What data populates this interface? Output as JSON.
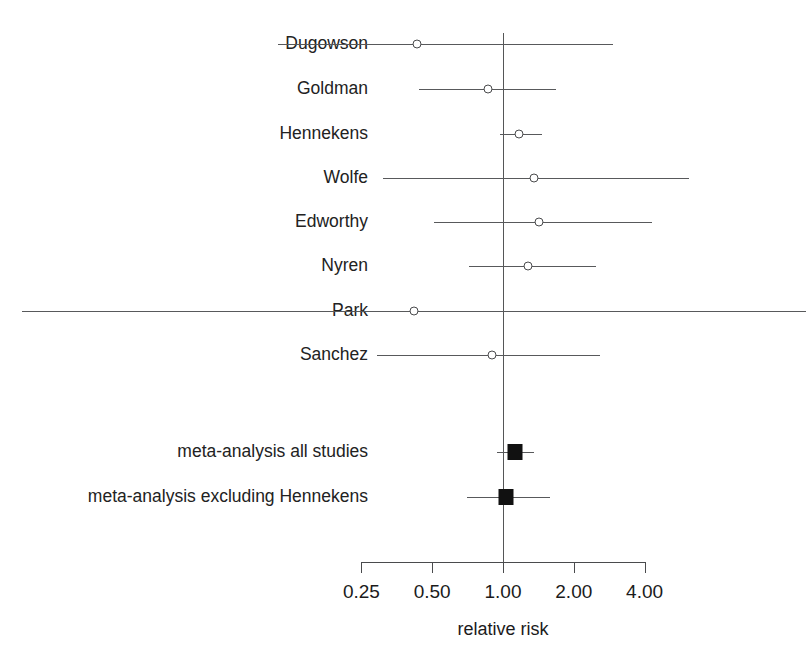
{
  "chart_data": {
    "type": "scatter",
    "subtype": "forest-plot",
    "title": "",
    "xlabel": "relative risk",
    "ylabel": "",
    "xscale": "log",
    "xlim": [
      0.25,
      4.0
    ],
    "grid": false,
    "legend": null,
    "null_line": 1.0,
    "tick_labels": [
      "0.25",
      "0.50",
      "1.00",
      "2.00",
      "4.00"
    ],
    "tick_values": [
      0.25,
      0.5,
      1.0,
      2.0,
      4.0
    ],
    "categories": [
      "Dugowson",
      "Goldman",
      "Hennekens",
      "Wolfe",
      "Edworthy",
      "Nyren",
      "Park",
      "Sanchez",
      "meta-analysis all studies",
      "meta-analysis excluding Hennekens"
    ],
    "rows": [
      {
        "label": "Dugowson",
        "marker": "open-circle",
        "estimate": 0.43,
        "ci_low": 0.11,
        "ci_high": 2.95,
        "ci_clipped_left": false,
        "ci_clipped_right": false
      },
      {
        "label": "Goldman",
        "marker": "open-circle",
        "estimate": 0.86,
        "ci_low": 0.44,
        "ci_high": 1.68,
        "ci_clipped_left": false,
        "ci_clipped_right": false
      },
      {
        "label": "Hennekens",
        "marker": "open-circle",
        "estimate": 1.17,
        "ci_low": 0.97,
        "ci_high": 1.46,
        "ci_clipped_left": false,
        "ci_clipped_right": false
      },
      {
        "label": "Wolfe",
        "marker": "open-circle",
        "estimate": 1.36,
        "ci_low": 0.31,
        "ci_high": 6.19,
        "ci_clipped_left": false,
        "ci_clipped_right": false
      },
      {
        "label": "Edworthy",
        "marker": "open-circle",
        "estimate": 1.42,
        "ci_low": 0.51,
        "ci_high": 4.28,
        "ci_clipped_left": false,
        "ci_clipped_right": false
      },
      {
        "label": "Nyren",
        "marker": "open-circle",
        "estimate": 1.28,
        "ci_low": 0.72,
        "ci_high": 2.49,
        "ci_clipped_left": false,
        "ci_clipped_right": false
      },
      {
        "label": "Park",
        "marker": "open-circle",
        "estimate": 0.42,
        "ci_low": 0.01,
        "ci_high": 20.0,
        "ci_clipped_left": true,
        "ci_clipped_right": true
      },
      {
        "label": "Sanchez",
        "marker": "open-circle",
        "estimate": 0.9,
        "ci_low": 0.29,
        "ci_high": 2.58,
        "ci_clipped_left": false,
        "ci_clipped_right": false
      },
      {
        "label": "meta-analysis all studies",
        "marker": "filled-square",
        "estimate": 1.12,
        "ci_low": 0.94,
        "ci_high": 1.36,
        "ci_clipped_left": false,
        "ci_clipped_right": false
      },
      {
        "label": "meta-analysis excluding Hennekens",
        "marker": "filled-square",
        "estimate": 1.03,
        "ci_low": 0.7,
        "ci_high": 1.58,
        "ci_clipped_left": false,
        "ci_clipped_right": false
      }
    ]
  },
  "colors": {
    "line": "#58595b",
    "marker_fill": "#ffffff",
    "marker_stroke": "#4a4b4d",
    "summary_marker": "#111111",
    "text": "#1b1b1b",
    "background": "#ffffff"
  }
}
